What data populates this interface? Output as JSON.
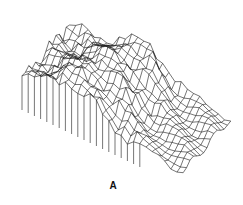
{
  "figure": {
    "panel_label": "A",
    "type": "3d-wireframe-surface",
    "line_color": "#1a1a1a",
    "background": "#ffffff",
    "grid": {
      "rows": 14,
      "cols": 26
    }
  }
}
